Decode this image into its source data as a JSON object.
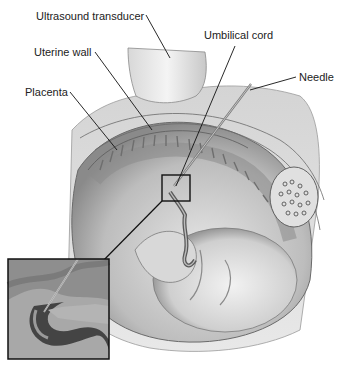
{
  "diagram": {
    "type": "medical-illustration",
    "labels": [
      {
        "id": "ultrasound-transducer",
        "text": "Ultrasound transducer"
      },
      {
        "id": "uterine-wall",
        "text": "Uterine wall"
      },
      {
        "id": "placenta",
        "text": "Placenta"
      },
      {
        "id": "umbilical-cord",
        "text": "Umbilical cord"
      },
      {
        "id": "needle",
        "text": "Needle"
      }
    ],
    "inset": {
      "description": "magnified view of needle entering umbilical cord"
    }
  }
}
